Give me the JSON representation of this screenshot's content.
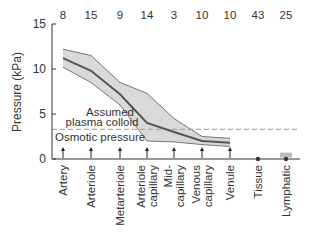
{
  "chart_data": {
    "type": "area",
    "title": "",
    "xlabel": "",
    "ylabel": "Pressure (kPa)",
    "ylim": [
      0,
      15
    ],
    "yticks": [
      0,
      5,
      10,
      15
    ],
    "grid": false,
    "categories": [
      "Artery",
      "Arteriole",
      "Metarteriole",
      "Arteriole capillary",
      "Mid-capillary",
      "Venous capillary",
      "Venule",
      "Tissue",
      "Lymphatic"
    ],
    "category_lines": [
      [
        "Artery"
      ],
      [
        "Arteriole"
      ],
      [
        "Metarteriole"
      ],
      [
        "Arteriole",
        "capillary"
      ],
      [
        "Mid-",
        "capillary"
      ],
      [
        "Venous",
        "capillary"
      ],
      [
        "Venule"
      ],
      [
        "Tissue"
      ],
      [
        "Lymphatic"
      ]
    ],
    "top_numbers": [
      8,
      15,
      9,
      14,
      3,
      10,
      10,
      43,
      25
    ],
    "series": [
      {
        "name": "Upper range",
        "values": [
          12.2,
          11.5,
          8.5,
          7.3,
          4.5,
          2.5,
          2.3,
          null,
          null
        ]
      },
      {
        "name": "Mean pressure",
        "values": [
          11.2,
          9.8,
          7.2,
          4.0,
          3.0,
          2.0,
          1.8,
          0.0,
          0.0
        ]
      },
      {
        "name": "Lower range",
        "values": [
          10.2,
          8.5,
          6.0,
          2.0,
          1.9,
          1.6,
          1.4,
          null,
          null
        ]
      }
    ],
    "lymphatic_range": [
      0,
      0.6
    ],
    "reference_line": {
      "value": 3.3,
      "style": "dashed",
      "label_lines": [
        "Assumed",
        "plasma colloid",
        "Osmotic pressure"
      ]
    },
    "colors": {
      "band": "#d9d9d9",
      "line": "#555555",
      "axis": "#333333",
      "dashed": "#999999"
    }
  }
}
